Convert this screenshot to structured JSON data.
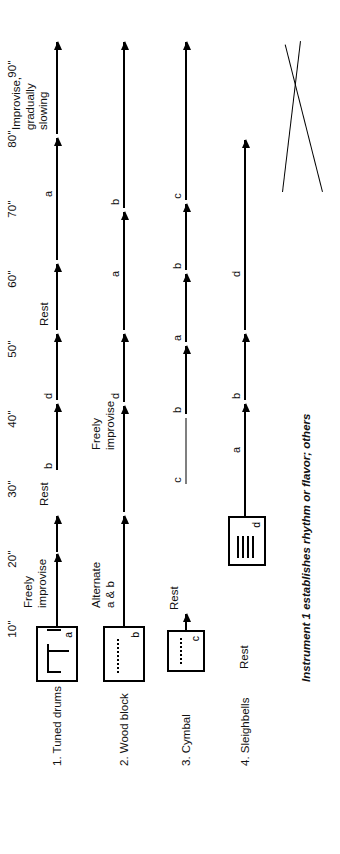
{
  "figure": {
    "orientation": "rotated-90-ccw",
    "caption": "Instrument 1 establishes rhythm or flavor; others",
    "ink_color": "#000000",
    "background_color": "#ffffff"
  },
  "timeline": {
    "unit_symbol": "\"",
    "ticks": [
      {
        "label": "10\"",
        "seconds": 10
      },
      {
        "label": "20\"",
        "seconds": 20
      },
      {
        "label": "30\"",
        "seconds": 30
      },
      {
        "label": "40\"",
        "seconds": 40
      },
      {
        "label": "50\"",
        "seconds": 50
      },
      {
        "label": "60\"",
        "seconds": 60
      },
      {
        "label": "70\"",
        "seconds": 70
      },
      {
        "label": "80\"",
        "seconds": 80
      },
      {
        "label": "90\"",
        "seconds": 90
      }
    ]
  },
  "rows": [
    {
      "name": "1. Tuned drums",
      "index": 1,
      "box": {
        "letter": "a",
        "notation": "beamed-notes"
      },
      "segments": [
        {
          "letter": "",
          "annotation": "Freely\nimprovise"
        },
        {
          "letter": "",
          "annotation": "Rest"
        },
        {
          "letter": "b",
          "annotation": ""
        },
        {
          "letter": "d",
          "annotation": ""
        },
        {
          "letter": "",
          "annotation": "Rest"
        },
        {
          "letter": "a",
          "annotation": ""
        },
        {
          "letter": "",
          "annotation": "Improvise,\ngradually\nslowing"
        }
      ]
    },
    {
      "name": "2. Wood block",
      "index": 2,
      "box": {
        "letter": "b",
        "notation": "dotted-roll"
      },
      "segments": [
        {
          "letter": "",
          "annotation": "Alternate\na & b"
        },
        {
          "letter": "",
          "annotation": "Freely\nimprovise"
        },
        {
          "letter": "d",
          "annotation": ""
        },
        {
          "letter": "a",
          "annotation": ""
        },
        {
          "letter": "b",
          "annotation": ""
        }
      ]
    },
    {
      "name": "3. Cymbal",
      "index": 3,
      "box": {
        "letter": "c",
        "notation": "dotted-roll"
      },
      "segments": [
        {
          "letter": "",
          "annotation": "Rest"
        },
        {
          "letter": "c",
          "annotation": ""
        },
        {
          "letter": "b",
          "annotation": ""
        },
        {
          "letter": "a",
          "annotation": ""
        },
        {
          "letter": "b",
          "annotation": ""
        },
        {
          "letter": "c",
          "annotation": ""
        }
      ]
    },
    {
      "name": "4. Sleighbells",
      "index": 4,
      "rest_label": "Rest",
      "box": {
        "letter": "d",
        "notation": "tremolo"
      },
      "segments": [
        {
          "letter": "a",
          "annotation": ""
        },
        {
          "letter": "b",
          "annotation": ""
        },
        {
          "letter": "d",
          "annotation": ""
        }
      ],
      "dynamic": {
        "type": "crescendo-hairpin"
      }
    }
  ]
}
